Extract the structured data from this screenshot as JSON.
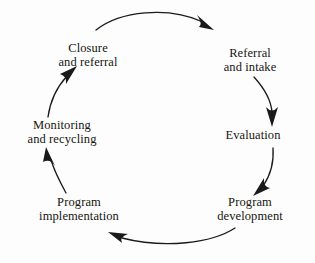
{
  "diagram": {
    "shape": "clockwise-cycle",
    "background_color": "#fdfdfd",
    "stroke_color": "#1a1a1a",
    "text_color": "#17150f",
    "nodes": [
      {
        "id": "closure",
        "label_line1": "Closure",
        "label_line2": "and referral",
        "x": 88,
        "y": 55
      },
      {
        "id": "referral-intake",
        "label_line1": "Referral",
        "label_line2": "and intake",
        "x": 250,
        "y": 60
      },
      {
        "id": "evaluation",
        "label_line1": "Evaluation",
        "label_line2": "",
        "x": 253,
        "y": 136
      },
      {
        "id": "program-development",
        "label_line1": "Program",
        "label_line2": "development",
        "x": 250,
        "y": 209
      },
      {
        "id": "program-implementation",
        "label_line1": "Program",
        "label_line2": "implementation",
        "x": 79,
        "y": 209
      },
      {
        "id": "monitoring-recycling",
        "label_line1": "Monitoring",
        "label_line2": "and recycling",
        "x": 62,
        "y": 132
      }
    ],
    "arrows": [
      {
        "id": "closure-to-referral",
        "from": "closure",
        "to": "referral-intake",
        "direction": "clockwise"
      },
      {
        "id": "referral-to-evaluation",
        "from": "referral-intake",
        "to": "evaluation",
        "direction": "clockwise"
      },
      {
        "id": "evaluation-to-development",
        "from": "evaluation",
        "to": "program-development",
        "direction": "clockwise"
      },
      {
        "id": "development-to-implementation",
        "from": "program-development",
        "to": "program-implementation",
        "direction": "clockwise"
      },
      {
        "id": "implementation-to-monitoring",
        "from": "program-implementation",
        "to": "monitoring-recycling",
        "direction": "clockwise"
      },
      {
        "id": "monitoring-to-closure",
        "from": "monitoring-recycling",
        "to": "closure",
        "direction": "clockwise"
      }
    ]
  }
}
